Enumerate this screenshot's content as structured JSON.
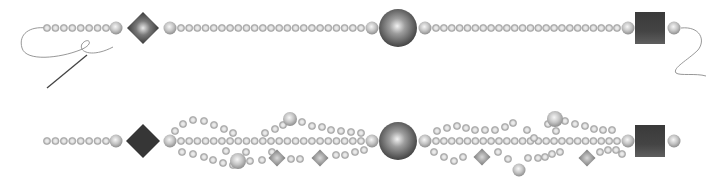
{
  "illustration": {
    "title": "Beaded strand patterns",
    "colors": {
      "background": "#ffffff",
      "bead_light": "#f4f4f4",
      "bead_mid": "#b9b9b9",
      "bead_dark": "#8a8a8a",
      "focal_dark": "#3a3a3a",
      "thread": "#8c8c8c",
      "needle": "#444444"
    },
    "strands": [
      {
        "name": "single-strand",
        "y": 28,
        "small_bead_r": 3.6,
        "segments": [
          {
            "type": "small-run",
            "x0": 47,
            "x1": 106,
            "count": 8
          },
          {
            "type": "medium",
            "x": 116,
            "r": 6.5
          },
          {
            "type": "diamond",
            "x": 143,
            "r": 16,
            "style": "gradient"
          },
          {
            "type": "medium",
            "x": 170,
            "r": 6.5
          },
          {
            "type": "small-run",
            "x0": 181,
            "x1": 361,
            "count": 23
          },
          {
            "type": "medium",
            "x": 372,
            "r": 6.5
          },
          {
            "type": "round",
            "x": 398,
            "r": 19
          },
          {
            "type": "medium",
            "x": 425,
            "r": 6.5
          },
          {
            "type": "small-run",
            "x0": 436,
            "x1": 617,
            "count": 24
          },
          {
            "type": "medium",
            "x": 628,
            "r": 6.5
          },
          {
            "type": "cube",
            "x": 650,
            "w": 30,
            "h": 32
          },
          {
            "type": "medium",
            "x": 674,
            "r": 6.5
          }
        ],
        "thread_left": "M46 28 C 30 26, 18 34, 22 48 C 26 62, 60 58, 80 50 C 96 44, 88 36, 82 44 C 78 52, 92 58, 113 47",
        "needle": {
          "x1": 47,
          "y1": 88,
          "x2": 87,
          "y2": 55
        },
        "thread_right": "M681 28 C 700 26, 706 40, 698 50 C 688 60, 672 68, 676 73 C 680 76, 696 73, 706 76"
      },
      {
        "name": "multi-strand",
        "y": 141,
        "small_bead_r": 3.6,
        "segments": [
          {
            "type": "small-run",
            "x0": 47,
            "x1": 106,
            "count": 8
          },
          {
            "type": "medium",
            "x": 116,
            "r": 6.5
          },
          {
            "type": "diamond",
            "x": 143,
            "r": 17,
            "style": "flat"
          },
          {
            "type": "medium",
            "x": 170,
            "r": 6.5
          },
          {
            "type": "small-run",
            "x0": 181,
            "x1": 361,
            "count": 23
          },
          {
            "type": "medium",
            "x": 372,
            "r": 6.5
          },
          {
            "type": "round",
            "x": 398,
            "r": 19
          },
          {
            "type": "medium",
            "x": 425,
            "r": 6.5
          },
          {
            "type": "small-run",
            "x0": 436,
            "x1": 617,
            "count": 24
          },
          {
            "type": "medium",
            "x": 628,
            "r": 6.5
          },
          {
            "type": "cube",
            "x": 650,
            "w": 30,
            "h": 32
          },
          {
            "type": "medium",
            "x": 674,
            "r": 6.5
          }
        ],
        "loops": [
          {
            "points": [
              [
                175,
                131
              ],
              [
                183,
                124
              ],
              [
                193,
                120
              ],
              [
                204,
                121
              ],
              [
                214,
                125
              ],
              [
                224,
                129
              ],
              [
                233,
                133
              ]
            ]
          },
          {
            "points": [
              [
                182,
                152
              ],
              [
                193,
                154
              ],
              [
                204,
                157
              ],
              [
                213,
                160
              ],
              [
                223,
                163
              ],
              [
                233,
                165
              ]
            ]
          },
          {
            "points": [
              [
                226,
                151
              ],
              [
                246,
                152
              ]
            ]
          },
          {
            "points": [
              [
                250,
                161
              ],
              [
                262,
                160
              ],
              [
                272,
                152
              ]
            ]
          },
          {
            "points": [
              [
                265,
                133
              ],
              [
                275,
                129
              ],
              [
                283,
                125
              ]
            ]
          },
          {
            "points": [
              [
                302,
                122
              ],
              [
                312,
                126
              ],
              [
                322,
                127
              ],
              [
                331,
                130
              ],
              [
                341,
                131
              ],
              [
                351,
                132
              ],
              [
                361,
                133
              ]
            ]
          },
          {
            "points": [
              [
                291,
                159
              ],
              [
                300,
                159
              ],
              [
                336,
                155
              ],
              [
                345,
                155
              ],
              [
                355,
                152
              ],
              [
                364,
                150
              ]
            ]
          },
          {
            "points": [
              [
                434,
                152
              ],
              [
                444,
                157
              ],
              [
                454,
                161
              ],
              [
                463,
                157
              ]
            ]
          },
          {
            "points": [
              [
                437,
                131
              ],
              [
                447,
                128
              ],
              [
                457,
                126
              ],
              [
                466,
                128
              ],
              [
                475,
                130
              ],
              [
                485,
                130
              ],
              [
                495,
                130
              ],
              [
                505,
                127
              ],
              [
                513,
                123
              ],
              [
                527,
                130
              ]
            ]
          },
          {
            "points": [
              [
                498,
                152
              ],
              [
                508,
                159
              ],
              [
                528,
                158
              ],
              [
                538,
                158
              ]
            ]
          },
          {
            "points": [
              [
                548,
                124
              ],
              [
                565,
                121
              ],
              [
                575,
                124
              ],
              [
                585,
                126
              ],
              [
                594,
                129
              ],
              [
                603,
                130
              ],
              [
                612,
                130
              ]
            ]
          },
          {
            "points": [
              [
                545,
                157
              ],
              [
                552,
                154
              ],
              [
                560,
                152
              ],
              [
                600,
                152
              ],
              [
                608,
                150
              ],
              [
                616,
                150
              ],
              [
                622,
                154
              ]
            ]
          },
          {
            "points": [
              [
                534,
                138
              ],
              [
                556,
                131
              ]
            ]
          }
        ],
        "accents": [
          {
            "type": "round",
            "x": 238,
            "y": 161,
            "r": 8
          },
          {
            "type": "round",
            "x": 290,
            "y": 119,
            "r": 7
          },
          {
            "type": "diamond",
            "x": 277,
            "y": 158,
            "r": 8.5,
            "style": "soft"
          },
          {
            "type": "diamond",
            "x": 320,
            "y": 158,
            "r": 8.5,
            "style": "soft"
          },
          {
            "type": "round",
            "x": 519,
            "y": 170,
            "r": 6.5
          },
          {
            "type": "round",
            "x": 555,
            "y": 119,
            "r": 8
          },
          {
            "type": "diamond",
            "x": 482,
            "y": 157,
            "r": 8.5,
            "style": "soft"
          },
          {
            "type": "diamond",
            "x": 587,
            "y": 158,
            "r": 8.5,
            "style": "soft"
          }
        ]
      }
    ]
  }
}
